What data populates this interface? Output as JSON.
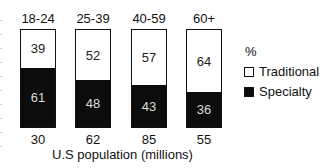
{
  "chart_data": {
    "type": "bar",
    "stacked": true,
    "percent": true,
    "categories": [
      "18-24",
      "25-39",
      "40-59",
      "60+"
    ],
    "series": [
      {
        "name": "Traditional",
        "color": "#ffffff",
        "values": [
          39,
          52,
          57,
          64
        ]
      },
      {
        "name": "Specialty",
        "color": "#0c0c0c",
        "values": [
          61,
          48,
          43,
          36
        ]
      }
    ],
    "population_millions": [
      30,
      62,
      85,
      55
    ],
    "title": "",
    "xlabel": "U.S population (millions)",
    "ylabel": "",
    "legend": {
      "title": "%",
      "position": "right",
      "entries": [
        "Traditional",
        "Specialty"
      ]
    },
    "ylim": [
      0,
      100
    ],
    "grid": false
  },
  "labels": {
    "groups": [
      "18-24",
      "25-39",
      "40-59",
      "60+"
    ],
    "traditional": [
      "39",
      "52",
      "57",
      "64"
    ],
    "specialty": [
      "61",
      "48",
      "43",
      "36"
    ],
    "population": [
      "30",
      "62",
      "85",
      "55"
    ],
    "xlabel": "U.S population (millions)",
    "legend_title": "%",
    "legend_traditional": "Traditional",
    "legend_specialty": "Specialty"
  }
}
